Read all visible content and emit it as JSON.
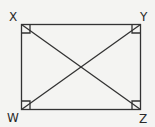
{
  "diagram": {
    "type": "rectangle-with-diagonals",
    "vertices": [
      {
        "label": "X",
        "position": "top-left"
      },
      {
        "label": "Y",
        "position": "top-right"
      },
      {
        "label": "W",
        "position": "bottom-left"
      },
      {
        "label": "Z",
        "position": "bottom-right"
      }
    ],
    "diagonals": [
      "XZ",
      "YW"
    ],
    "right_angle_markers": [
      "X",
      "Y",
      "W",
      "Z"
    ],
    "colors": {
      "stroke": "#333333",
      "background": "#f4f4f2"
    }
  }
}
